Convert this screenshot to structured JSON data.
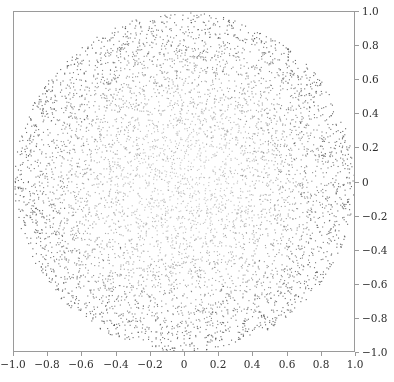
{
  "chart_data": {
    "type": "scatter",
    "title": "",
    "subtitle": "",
    "xlabel": "",
    "ylabel": "",
    "xlim": [
      -1.0,
      1.0
    ],
    "ylim": [
      -1.0,
      1.0
    ],
    "grid": false,
    "legend": null,
    "legend_position": "none",
    "y_axis_side": "right",
    "x_axis_side": "bottom",
    "point_color": "#555555",
    "point_size_px": 1.1,
    "frame_color": "#9a9a9a",
    "background_color": "#ffffff",
    "n_points": 6000,
    "distribution": {
      "shape": "unit-disk",
      "center": [
        0.0,
        0.0
      ],
      "radius": 1.0,
      "radial_profile": "density-increasing-outward",
      "radial_exponent": 1.9
    },
    "x_ticks": [
      -1.0,
      -0.8,
      -0.6,
      -0.4,
      -0.2,
      0,
      0.2,
      0.4,
      0.6,
      0.8,
      1.0
    ],
    "x_tick_labels": [
      "−1.0",
      "−0.8",
      "−0.6",
      "−0.4",
      "−0.2",
      "0",
      "0.2",
      "0.4",
      "0.6",
      "0.8",
      "1.0"
    ],
    "y_ticks": [
      1.0,
      0.8,
      0.6,
      0.4,
      0.2,
      0,
      -0.2,
      -0.4,
      -0.6,
      -0.8,
      -1.0
    ],
    "y_tick_labels": [
      "1.0",
      "0.8",
      "0.6",
      "0.4",
      "0.2",
      "0",
      "−0.2",
      "−0.4",
      "−0.6",
      "−0.8",
      "−1.0"
    ],
    "series": [
      {
        "name": "points",
        "marker": "point",
        "color": "#555555"
      }
    ]
  },
  "figure": {
    "plot_area": {
      "left": 13,
      "top": 11,
      "width": 342,
      "height": 341
    }
  }
}
